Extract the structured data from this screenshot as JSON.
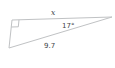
{
  "diagram": {
    "type": "right-triangle",
    "labels": {
      "top_side": "x",
      "angle_at_right_vertex": "17°",
      "hypotenuse": "9.7"
    },
    "right_angle_marker": true,
    "colors": {
      "line": "#c0c2c4",
      "text": "#414447",
      "background": "#ffffff"
    }
  }
}
